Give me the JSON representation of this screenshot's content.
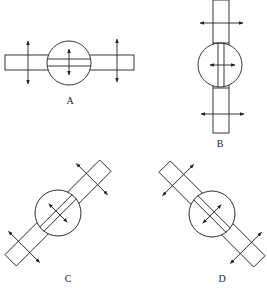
{
  "diagrams": [
    {
      "id": "A",
      "label": "A",
      "orientation": "horizontal",
      "description": "Horizontal bar through circle with vertical double-headed arrows"
    },
    {
      "id": "B",
      "label": "B",
      "orientation": "vertical",
      "description": "Vertical bar through circle with horizontal double-headed arrows"
    },
    {
      "id": "C",
      "label": "C",
      "orientation": "diagonal-up-right",
      "description": "Bar rotated 45 degrees (rising right) through circle with perpendicular double-headed arrows"
    },
    {
      "id": "D",
      "label": "D",
      "orientation": "diagonal-down-right",
      "description": "Bar rotated 45 degrees (falling right) through circle with perpendicular double-headed arrows"
    }
  ],
  "colors": {
    "line": "#222222",
    "background": "#ffffff"
  }
}
